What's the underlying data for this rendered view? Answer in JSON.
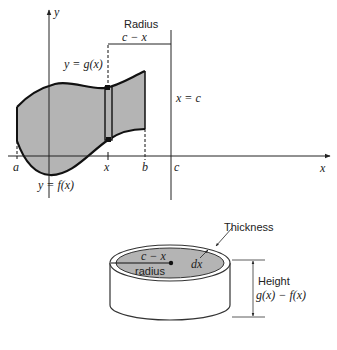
{
  "top_figure": {
    "axis_labels": {
      "y": "y",
      "x": "x"
    },
    "tick_labels": {
      "a": "a",
      "x": "x",
      "b": "b",
      "c": "c"
    },
    "curve_labels": {
      "upper": "y = g(x)",
      "lower": "y = f(x)"
    },
    "line_label": "x = c",
    "radius_title": "Radius",
    "radius_value": "c − x",
    "colors": {
      "region_fill": "#b4b4b4",
      "stroke": "#111111"
    }
  },
  "bottom_figure": {
    "thickness_label": "Thickness",
    "thickness_value": "dx",
    "radius_value": "c − x",
    "radius_label": "radius",
    "height_label": "Height",
    "height_value": "g(x) − f(x)",
    "colors": {
      "top_fill": "#b4b4b4",
      "stroke": "#333333"
    }
  }
}
